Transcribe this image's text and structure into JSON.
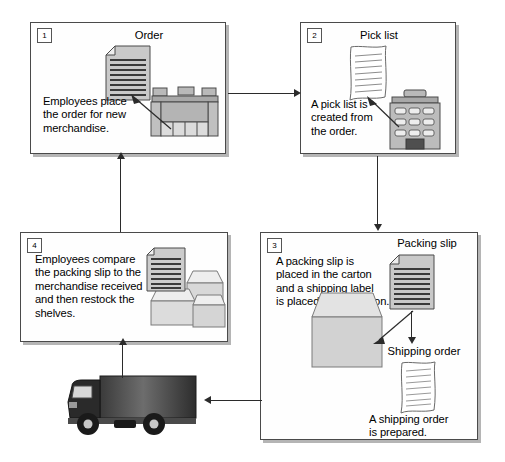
{
  "diagram": {
    "type": "process-flowchart",
    "colors": {
      "line": "#2b2b2b",
      "panel_border": "#4a4a4a",
      "panel_fill": "#fefefe",
      "shadow": "#787878",
      "art_gray": "#b8b8b8",
      "art_dark": "#4a4a4a",
      "truck_dark": "#262626"
    },
    "steps": [
      {
        "number": "1",
        "caption": "Order",
        "text": "Employees place\nthe order for new\nmerchandise.",
        "icons": [
          "document-icon",
          "warehouse-building-icon"
        ]
      },
      {
        "number": "2",
        "caption": "Pick list",
        "text": "A pick list is\ncreated from\nthe order.",
        "icons": [
          "wavy-document-icon",
          "office-building-icon"
        ]
      },
      {
        "number": "3",
        "caption": "Packing slip",
        "caption2": "Shipping order",
        "text": "A packing slip is\nplaced in the carton\nand a shipping label\nis placed on the carton.",
        "text2": "A shipping order\nis prepared.",
        "icons": [
          "document-icon",
          "carton-icon",
          "wavy-document-icon"
        ]
      },
      {
        "number": "4",
        "text": "Employees compare\nthe packing slip to the\nmerchandise received\nand then restock the\nshelves.",
        "icons": [
          "document-icon",
          "cartons-stack-icon"
        ]
      }
    ],
    "transport": {
      "icon": "delivery-truck-icon"
    },
    "flow": [
      {
        "from": "1",
        "to": "2",
        "direction": "right"
      },
      {
        "from": "2",
        "to": "3",
        "direction": "down"
      },
      {
        "from": "3",
        "to": "truck",
        "direction": "left"
      },
      {
        "from": "truck",
        "to": "4",
        "direction": "up"
      },
      {
        "from": "4",
        "to": "1",
        "direction": "up"
      }
    ]
  }
}
